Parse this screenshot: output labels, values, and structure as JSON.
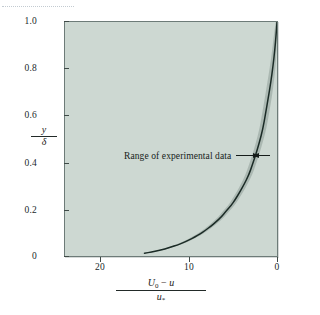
{
  "figure": {
    "background_color": "#ffffff",
    "plot_background_color": "#cdd8d2",
    "frame_color": "#6d7b78",
    "curve_color": "#1b2b26",
    "band_color": "#a8b5af"
  },
  "annotation": {
    "label": "Range of experimental data",
    "left_arrow_icon": "arrow-right-icon",
    "right_arrow_icon": "arrow-left-icon"
  },
  "axes": {
    "y_title": {
      "numerator": "y",
      "denominator": "δ"
    },
    "x_title": {
      "numerator_u0": "U",
      "numerator_u0_sub": "0",
      "numerator_minus": " − ",
      "numerator_u": "u",
      "denominator_u": "u",
      "denominator_sub": "*"
    }
  },
  "chart_data": {
    "type": "line",
    "title": "",
    "subtitle": "",
    "xlabel": "(U0 − u)/u*",
    "ylabel": "y/δ",
    "xlim": [
      24,
      0
    ],
    "ylim": [
      0,
      1.0
    ],
    "x_inverted": true,
    "grid": false,
    "legend": "none",
    "xticks": [
      20,
      10,
      0
    ],
    "xticklabels": [
      "20",
      "10",
      "0"
    ],
    "yticks": [
      0,
      0.2,
      0.4,
      0.6,
      0.8,
      1.0
    ],
    "yticklabels": [
      "0",
      "0.2",
      "0.4",
      "0.6",
      "0.8",
      "1.0"
    ],
    "annotations": [
      {
        "text": "Range of experimental data",
        "x": 3.3,
        "y": 0.45,
        "arrow_left_to": 2.6,
        "arrow_right_to": 2.0
      }
    ],
    "series": [
      {
        "name": "velocity defect law (mean curve)",
        "type": "line",
        "color": "#1b2b26",
        "x": [
          15.0,
          14.2,
          13.4,
          12.7,
          12.0,
          11.3,
          10.6,
          10.0,
          9.3,
          8.7,
          8.1,
          7.5,
          6.9,
          6.3,
          5.8,
          5.2,
          4.7,
          4.2,
          3.7,
          3.2,
          2.8,
          2.4,
          2.0,
          1.6,
          1.3,
          1.0,
          0.7,
          0.45,
          0.25,
          0.1,
          0.0
        ],
        "y": [
          0.012,
          0.017,
          0.023,
          0.03,
          0.038,
          0.047,
          0.057,
          0.068,
          0.081,
          0.095,
          0.11,
          0.127,
          0.146,
          0.167,
          0.19,
          0.215,
          0.243,
          0.274,
          0.308,
          0.346,
          0.388,
          0.434,
          0.485,
          0.543,
          0.607,
          0.673,
          0.742,
          0.812,
          0.88,
          0.946,
          1.0
        ]
      },
      {
        "name": "experimental data band (upper edge)",
        "type": "band-edge",
        "color": "#a8b5af",
        "x": [
          15.4,
          14.6,
          13.8,
          13.1,
          12.4,
          11.7,
          11.0,
          10.4,
          9.7,
          9.1,
          8.5,
          7.9,
          7.3,
          6.7,
          6.2,
          5.6,
          5.1,
          4.6,
          4.1,
          3.6,
          3.2,
          2.8,
          2.4,
          2.0,
          1.7,
          1.4,
          1.1,
          0.8,
          0.55,
          0.35,
          0.15
        ],
        "y": [
          0.01,
          0.015,
          0.021,
          0.028,
          0.036,
          0.045,
          0.055,
          0.066,
          0.079,
          0.093,
          0.108,
          0.125,
          0.144,
          0.165,
          0.188,
          0.213,
          0.241,
          0.272,
          0.306,
          0.344,
          0.386,
          0.432,
          0.483,
          0.541,
          0.605,
          0.671,
          0.74,
          0.81,
          0.878,
          0.944,
          1.0
        ]
      },
      {
        "name": "experimental data band (lower edge)",
        "type": "band-edge",
        "color": "#a8b5af",
        "x": [
          14.6,
          13.8,
          13.0,
          12.3,
          11.6,
          10.9,
          10.2,
          9.6,
          8.9,
          8.3,
          7.7,
          7.1,
          6.5,
          5.9,
          5.4,
          4.8,
          4.3,
          3.8,
          3.3,
          2.8,
          2.4,
          2.0,
          1.6,
          1.2,
          0.9,
          0.6,
          0.35,
          0.15,
          0.05,
          0.0,
          0.0
        ],
        "y": [
          0.014,
          0.019,
          0.025,
          0.032,
          0.04,
          0.049,
          0.059,
          0.07,
          0.083,
          0.097,
          0.112,
          0.129,
          0.148,
          0.169,
          0.192,
          0.217,
          0.245,
          0.276,
          0.31,
          0.348,
          0.39,
          0.436,
          0.487,
          0.545,
          0.609,
          0.675,
          0.744,
          0.814,
          0.882,
          0.948,
          1.0
        ]
      }
    ]
  }
}
